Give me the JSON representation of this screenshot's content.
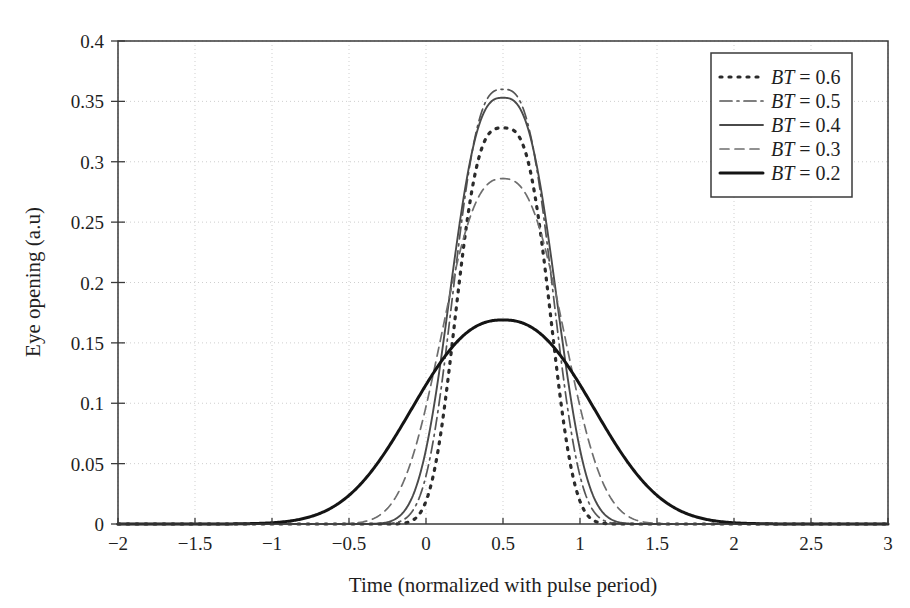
{
  "chart_data": {
    "type": "line",
    "title": "",
    "xlabel": "Time (normalized with pulse period)",
    "ylabel": "Eye opening (a.u)",
    "xlim": [
      -2,
      3
    ],
    "ylim": [
      0,
      0.4
    ],
    "xticks": [
      -2,
      -1.5,
      -1,
      -0.5,
      0,
      0.5,
      1,
      1.5,
      2,
      2.5,
      3
    ],
    "xtick_labels": [
      "−2",
      "−1.5",
      "−1",
      "−0.5",
      "0",
      "0.5",
      "1",
      "1.5",
      "2",
      "2.5",
      "3"
    ],
    "yticks": [
      0,
      0.05,
      0.1,
      0.15,
      0.2,
      0.25,
      0.3,
      0.35,
      0.4
    ],
    "ytick_labels": [
      "0",
      "0.05",
      "0.1",
      "0.15",
      "0.2",
      "0.25",
      "0.3",
      "0.35",
      "0.4"
    ],
    "grid": true,
    "grid_style": "dotted",
    "legend_position": "top-right",
    "peak_x": 0.5,
    "series": [
      {
        "name": "BT = 0.6",
        "label_prefix": "BT",
        "label_value": "0.6",
        "dash": "2,7",
        "width": 3.2,
        "color": "#2b2b2b",
        "peak": 0.328,
        "sigma": 0.285,
        "shape": 1.55
      },
      {
        "name": "BT = 0.5",
        "label_prefix": "BT",
        "label_value": "0.5",
        "dash": "12,5,2,5",
        "width": 1.7,
        "color": "#555555",
        "peak": 0.36,
        "sigma": 0.3,
        "shape": 1.45
      },
      {
        "name": "BT = 0.4",
        "label_prefix": "BT",
        "label_value": "0.4",
        "dash": "",
        "width": 1.9,
        "color": "#4a4a4a",
        "peak": 0.353,
        "sigma": 0.32,
        "shape": 1.4
      },
      {
        "name": "BT = 0.3",
        "label_prefix": "BT",
        "label_value": "0.3",
        "dash": "9,6",
        "width": 1.7,
        "color": "#6e6e6e",
        "peak": 0.286,
        "sigma": 0.372,
        "shape": 1.3
      },
      {
        "name": "BT = 0.2",
        "label_prefix": "BT",
        "label_value": "0.2",
        "dash": "",
        "width": 3.0,
        "color": "#141414",
        "peak": 0.169,
        "sigma": 0.56,
        "shape": 1.18
      }
    ]
  },
  "legend": {
    "entries": [
      {
        "label": "BT = 0.6"
      },
      {
        "label": "BT = 0.5"
      },
      {
        "label": "BT = 0.4"
      },
      {
        "label": "BT = 0.3"
      },
      {
        "label": "BT = 0.2"
      }
    ]
  },
  "axes": {
    "frame_color": "#3a3a3a",
    "grid_color": "#c9c9c9",
    "background": "#ffffff"
  }
}
